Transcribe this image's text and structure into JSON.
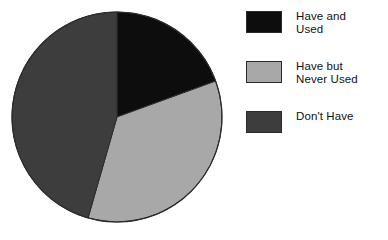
{
  "chart_data": {
    "type": "pie",
    "title": "",
    "subtitle": "",
    "xlabel": "",
    "ylabel": "",
    "grid": false,
    "legend_position": "right",
    "start_angle_deg": 0,
    "direction": "clockwise",
    "center": {
      "x": 117,
      "y": 117
    },
    "radius": 105,
    "categories": [
      "Have and Used",
      "Have but Never Used",
      "Don't Have"
    ],
    "values": [
      19.4,
      35.0,
      45.6
    ],
    "angles_deg": [
      70,
      126,
      164
    ],
    "colors": [
      "#0d0d0d",
      "#a8a8a8",
      "#3d3d3d"
    ],
    "slice_outline_color": "#2b2b2b",
    "slices": [
      {
        "label": "Have and Used",
        "legend_label": "Have and\nUsed",
        "value": 19.4,
        "angle_deg": 70,
        "start_deg": 0,
        "end_deg": 70,
        "color": "#0d0d0d"
      },
      {
        "label": "Have but Never Used",
        "legend_label": "Have but\nNever Used",
        "value": 35.0,
        "angle_deg": 126,
        "start_deg": 70,
        "end_deg": 196,
        "color": "#a8a8a8"
      },
      {
        "label": "Don't Have",
        "legend_label": "Don't Have",
        "value": 45.6,
        "angle_deg": 164,
        "start_deg": 196,
        "end_deg": 360,
        "color": "#3d3d3d"
      }
    ]
  },
  "legend": {
    "items": [
      {
        "label": "Have and\nUsed",
        "color": "#0d0d0d",
        "swatch_name": "legend-swatch-have-and-used"
      },
      {
        "label": "Have but\nNever Used",
        "color": "#a8a8a8",
        "swatch_name": "legend-swatch-have-but-never-used"
      },
      {
        "label": "Don't Have",
        "color": "#3d3d3d",
        "swatch_name": "legend-swatch-dont-have"
      }
    ]
  },
  "colors": {
    "background": "#ffffff",
    "text": "#111111",
    "outline": "#2b2b2b"
  }
}
